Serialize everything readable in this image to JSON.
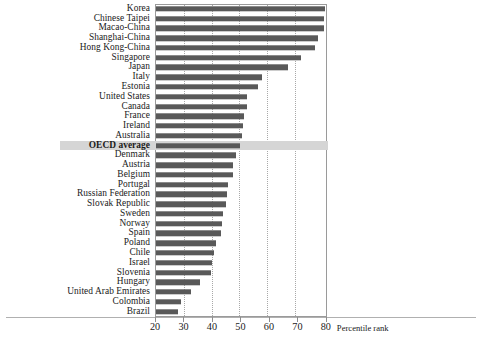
{
  "chart_data": {
    "type": "bar",
    "orientation": "horizontal",
    "title": "",
    "subtitle": "",
    "xlabel": "Percentile rank",
    "ylabel": "",
    "xlim": [
      20,
      80.4
    ],
    "xticks": [
      20,
      30,
      40,
      50,
      60,
      70,
      80
    ],
    "xtick_labels": [
      "20",
      "30",
      "40",
      "50",
      "60",
      "70",
      "80"
    ],
    "grid": "vertical-dotted",
    "legend": "none",
    "bar_color": "#595959",
    "highlight_color": "#d5d5d5",
    "highlight_category": "OECD average",
    "categories": [
      "Korea",
      "Chinese Taipei",
      "Macao-China",
      "Shanghai-China",
      "Hong Kong-China",
      "Singapore",
      "Japan",
      "Italy",
      "Estonia",
      "United States",
      "Canada",
      "France",
      "Ireland",
      "Australia",
      "OECD average",
      "Denmark",
      "Austria",
      "Belgium",
      "Portugal",
      "Russian Federation",
      "Slovak Republic",
      "Sweden",
      "Norway",
      "Spain",
      "Poland",
      "Chile",
      "Israel",
      "Slovenia",
      "Hungary",
      "United Arab Emirates",
      "Colombia",
      "Brazil"
    ],
    "values": [
      79.3,
      79.0,
      78.9,
      77.0,
      75.8,
      71.0,
      66.4,
      57.3,
      55.7,
      52.0,
      51.9,
      51.0,
      50.7,
      50.2,
      49.5,
      48.0,
      47.2,
      46.9,
      45.4,
      44.8,
      44.7,
      43.6,
      43.1,
      42.8,
      40.9,
      40.4,
      39.6,
      39.3,
      35.5,
      32.2,
      28.8,
      27.9
    ]
  },
  "axis": {
    "x_title": "Percentile rank"
  }
}
